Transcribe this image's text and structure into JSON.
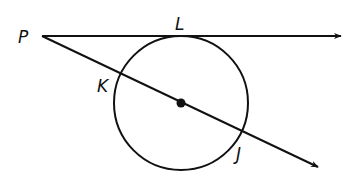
{
  "diagram": {
    "type": "geometry",
    "colors": {
      "stroke": "#111111",
      "background": "#ffffff"
    },
    "points": {
      "P": {
        "label": "P",
        "x": 42,
        "y": 36
      },
      "L": {
        "label": "L",
        "x": 182,
        "y": 36
      },
      "K": {
        "label": "K",
        "x": 122,
        "y": 73
      },
      "J": {
        "label": "J",
        "x": 240,
        "y": 135
      },
      "center": {
        "x": 181,
        "y": 103
      }
    },
    "circle": {
      "cx": 181,
      "cy": 103,
      "r": 67
    },
    "rays": [
      {
        "name": "tangent-ray-PL",
        "from": "P",
        "through": "L",
        "tip": {
          "x": 343,
          "y": 36
        }
      },
      {
        "name": "secant-ray-PJ",
        "from": "P",
        "through": [
          "K",
          "center",
          "J"
        ],
        "tip": {
          "x": 320,
          "y": 168
        }
      }
    ],
    "labels": {
      "P": "P",
      "L": "L",
      "K": "K",
      "J": "J"
    }
  }
}
